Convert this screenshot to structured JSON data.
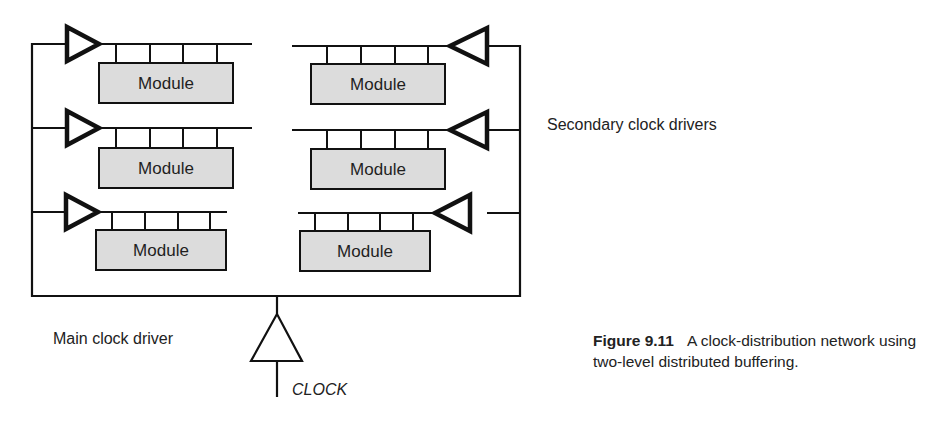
{
  "diagram": {
    "title": "Clock-distribution network",
    "module_label": "Module",
    "modules": [
      {
        "side": "left",
        "row": 1,
        "label": "Module"
      },
      {
        "side": "right",
        "row": 1,
        "label": "Module"
      },
      {
        "side": "left",
        "row": 2,
        "label": "Module"
      },
      {
        "side": "right",
        "row": 2,
        "label": "Module"
      },
      {
        "side": "left",
        "row": 3,
        "label": "Module"
      },
      {
        "side": "right",
        "row": 3,
        "label": "Module"
      }
    ],
    "secondary_drivers_label": "Secondary clock drivers",
    "main_driver_label": "Main clock driver",
    "clock_input_label": "CLOCK",
    "colors": {
      "line": "#111111",
      "module_fill": "#dcdcdc"
    }
  },
  "caption": {
    "figure_number": "Figure 9.11",
    "text": "A clock-distribution network using two-level distributed buffering."
  }
}
